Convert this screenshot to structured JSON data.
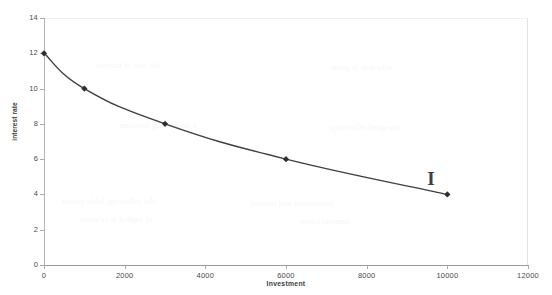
{
  "chart_data": {
    "type": "line",
    "title": "",
    "xlabel": "Investment",
    "ylabel": "interest rate",
    "xlim": [
      0,
      12000
    ],
    "ylim": [
      0,
      14
    ],
    "grid": false,
    "legend": null,
    "x": [
      0,
      1000,
      3000,
      6000,
      10000
    ],
    "values": [
      12,
      10,
      8,
      6,
      4
    ],
    "series": [
      {
        "name": "interest rate",
        "x": [
          0,
          1000,
          3000,
          6000,
          10000
        ],
        "values": [
          12,
          10,
          8,
          6,
          4
        ],
        "marker": "diamond",
        "color": "#3f3f3f"
      }
    ],
    "xticks": [
      0,
      2000,
      4000,
      6000,
      8000,
      10000,
      12000
    ],
    "xtick_labels": [
      "0",
      "2000",
      "4000",
      "6000",
      "8000",
      "10000",
      "12000"
    ],
    "yticks": [
      0,
      2,
      4,
      6,
      8,
      10,
      12,
      14
    ],
    "ytick_labels": [
      "0",
      "2",
      "4",
      "6",
      "8",
      "10",
      "12",
      "14"
    ],
    "annotations": [
      {
        "text": "I",
        "x": 9600,
        "y": 4.9
      }
    ]
  },
  "colors": {
    "line": "#3f3f3f",
    "marker": "#2f2f2f",
    "axis": "#9a9a9a",
    "tick_text": "#4a4a4a",
    "background": "#ffffff"
  },
  "scan_artifacts": [
    {
      "text": "the following table shows",
      "x": 62,
      "y": 196
    },
    {
      "text": "investment and interest",
      "x": 250,
      "y": 198
    },
    {
      "text": "of capital in relation",
      "x": 80,
      "y": 214
    },
    {
      "text": "demand curve",
      "x": 300,
      "y": 216
    },
    {
      "text": "a decreasing function",
      "x": 120,
      "y": 120
    },
    {
      "text": "marginal efficiency",
      "x": 330,
      "y": 122
    },
    {
      "text": "the rate of interest",
      "x": 95,
      "y": 60
    },
    {
      "text": "schedule is given",
      "x": 330,
      "y": 62
    }
  ]
}
